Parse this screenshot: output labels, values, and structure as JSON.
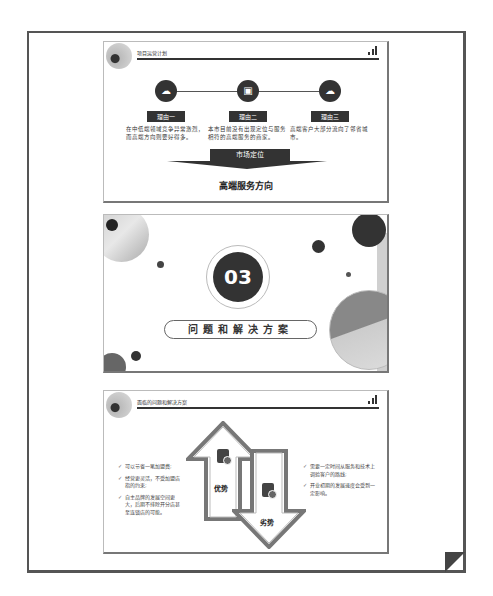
{
  "document": {
    "slides": [
      {
        "header_title": "项目运营计划",
        "reasons": [
          {
            "label": "理由一",
            "icon": "cloud-icon",
            "description": "在中低端领域竞争异常激烈，而高端方向则要好得多。"
          },
          {
            "label": "理由二",
            "icon": "monitor-icon",
            "description": "本市目前没有出现定位与服务相符的高端服务的商家。"
          },
          {
            "label": "理由三",
            "icon": "cloud-icon",
            "description": "高端客户大部分流向了邻省城市。"
          }
        ],
        "market_label": "市场定位",
        "market_result": "高端服务方向"
      },
      {
        "section_number": "03",
        "section_title": "问题和解决方案"
      },
      {
        "header_title": "面临的问题和解决方案",
        "advantage_label": "优势",
        "disadvantage_label": "劣势",
        "advantages": [
          "可以节省一笔加盟费;",
          "经营更灵活，不受加盟店指的约束;",
          "自主品牌的发展空间更大，后期不排除开分店甚至连锁店的可能。"
        ],
        "disadvantages": [
          "需要一定时间从服务和技术上调验客户的路线;",
          "开业初期的发展速度会受到一定影响。"
        ]
      }
    ]
  },
  "colors": {
    "primary_dark": "#333333",
    "frame": "#555555",
    "accent_gray": "#888888"
  }
}
